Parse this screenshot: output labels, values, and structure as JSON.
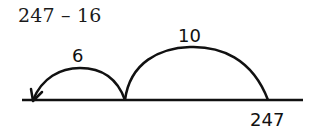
{
  "problem": {
    "expression": "247 – 16"
  },
  "number_line": {
    "start_label": "247",
    "jumps": [
      {
        "label": "10",
        "direction": "left"
      },
      {
        "label": "6",
        "direction": "left"
      }
    ]
  }
}
